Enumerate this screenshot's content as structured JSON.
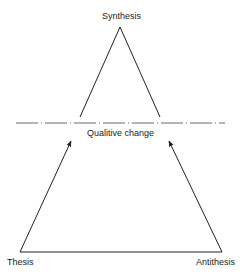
{
  "diagram": {
    "apex_label": "Synthesis",
    "divider_label": "Qualitive change",
    "left_label": "Thesis",
    "right_label": "Antithesis"
  },
  "colors": {
    "line": "#222222",
    "background": "#ffffff"
  }
}
